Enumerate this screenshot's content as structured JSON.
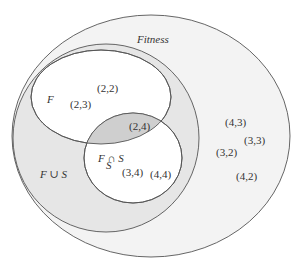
{
  "diagram": {
    "type": "venn",
    "colors": {
      "background": "#ffffff",
      "fitness_fill": "#f3f3f3",
      "union_fill": "#e6e6e6",
      "set_fill": "#ffffff",
      "intersection_fill": "#cfcfcf",
      "stroke": "#555555",
      "text": "#333333"
    },
    "regions": {
      "fitness": {
        "label": "Fitness",
        "points": [
          "(4,3)",
          "(3,3)",
          "(3,2)",
          "(4,2)"
        ]
      },
      "union": {
        "label": "F ∪ S"
      },
      "F": {
        "label": "F",
        "points": [
          "(2,2)",
          "(2,3)"
        ]
      },
      "intersection": {
        "label": "F ∩ S",
        "points": [
          "(2,4)"
        ]
      },
      "S": {
        "label": "S",
        "points": [
          "(3,4)",
          "(4,4)"
        ]
      }
    }
  }
}
